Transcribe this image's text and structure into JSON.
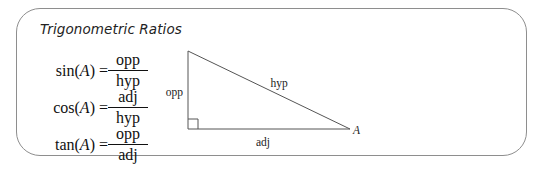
{
  "title": "Trigonometric Ratios",
  "formulas": [
    {
      "func": "sin",
      "arg": "A",
      "lhs": "sin(",
      "rhs_close": ") =",
      "numerator": "opp",
      "denominator": "hyp"
    },
    {
      "func": "cos",
      "arg": "A",
      "lhs": "cos(",
      "rhs_close": ") =",
      "numerator": "adj",
      "denominator": "hyp"
    },
    {
      "func": "tan",
      "arg": "A",
      "lhs": "tan(",
      "rhs_close": ") =",
      "numerator": "opp",
      "denominator": "adj"
    }
  ],
  "triangle": {
    "labels": {
      "opposite": "opp",
      "hypotenuse": "hyp",
      "adjacent": "adj",
      "angle": "A"
    },
    "right_angle_marker": true
  },
  "colors": {
    "border": "#8e8e8e",
    "line": "#555555",
    "text": "#111111"
  }
}
